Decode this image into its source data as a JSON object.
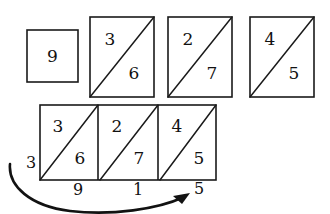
{
  "figure": {
    "ink_color": "#1a1a1a",
    "background_color": "#ffffff",
    "top_row": {
      "name": "partial-product-tiles",
      "tiles": [
        {
          "id": "tile-units",
          "has_diagonal": false,
          "upper_digit": "",
          "lower_digit": "",
          "single_digit": "9",
          "x": 27,
          "y": 30,
          "w": 51,
          "h": 52
        },
        {
          "id": "tile-tens",
          "has_diagonal": true,
          "upper_digit": "3",
          "lower_digit": "6",
          "single_digit": "",
          "x": 90,
          "y": 17,
          "w": 64,
          "h": 80
        },
        {
          "id": "tile-hundreds",
          "has_diagonal": true,
          "upper_digit": "2",
          "lower_digit": "7",
          "single_digit": "",
          "x": 168,
          "y": 17,
          "w": 64,
          "h": 80
        },
        {
          "id": "tile-thousands",
          "has_diagonal": true,
          "upper_digit": "4",
          "lower_digit": "5",
          "single_digit": "",
          "x": 250,
          "y": 17,
          "w": 64,
          "h": 80
        }
      ]
    },
    "bottom_row": {
      "name": "assembled-lattice-strip",
      "x": 40,
      "y": 105,
      "w": 176,
      "h": 75,
      "cells": [
        {
          "id": "lattice-cell-1",
          "upper_digit": "3",
          "lower_digit": "6"
        },
        {
          "id": "lattice-cell-2",
          "upper_digit": "2",
          "lower_digit": "7"
        },
        {
          "id": "lattice-cell-3",
          "upper_digit": "4",
          "lower_digit": "5"
        }
      ],
      "left_label": "3",
      "bottom_labels": [
        "9",
        "1",
        "5"
      ]
    },
    "arrow": {
      "name": "reading-direction-arrow",
      "description": "curved arrow sweeping from lower-left up to the right beneath the lattice strip",
      "start_x": 10,
      "start_y": 164,
      "end_x": 188,
      "end_y": 196
    }
  }
}
